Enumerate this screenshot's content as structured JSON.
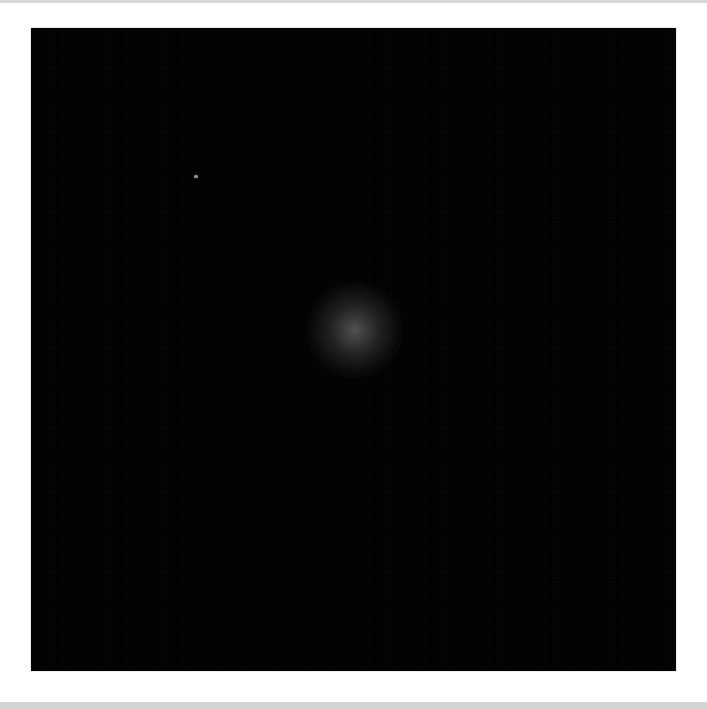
{
  "image": {
    "description": "dark field image with faint diffuse glow near center",
    "background_color": "#030303",
    "frame": {
      "x": 31,
      "y": 28,
      "width": 645,
      "height": 643
    },
    "features": [
      {
        "type": "diffuse-glow",
        "cx": 355,
        "cy": 330,
        "radius": 48,
        "color": "#5f5f5f"
      },
      {
        "type": "bright-speck",
        "cx": 196,
        "cy": 176,
        "color": "#9a9a9a"
      }
    ]
  },
  "chrome": {
    "top_bar_color": "#d8d8d8",
    "bottom_bar_color": "#d4d4d4"
  }
}
